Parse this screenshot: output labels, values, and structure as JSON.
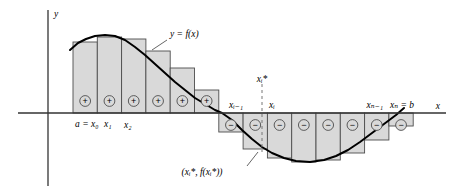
{
  "figure": {
    "axes": {
      "x_label": "x",
      "y_label": "y",
      "x_axis_y_px": 113,
      "y_axis_x_px": 48,
      "x_axis_from_px": 18,
      "x_axis_to_px": 446,
      "y_axis_from_px": 10,
      "y_axis_to_px": 186
    },
    "colors": {
      "rect_fill": "#d9d9d9",
      "rect_stroke": "#4d4d4d",
      "curve_stroke": "#000000",
      "axis_stroke": "#333333",
      "leader_stroke": "#555555",
      "dashed_stroke": "#777777",
      "text": "#000000"
    },
    "curve_label": "y = f(x)",
    "point_label": "(xᵢ*, f(xᵢ*))",
    "labels": {
      "a_x0": "a = x₀",
      "x1": "x₁",
      "x2": "x₂",
      "xi_minus_1": "xᵢ₋₁",
      "xi": "xᵢ",
      "xi_star": "xᵢ*",
      "xn_minus_1": "xₙ₋₁",
      "xn_b": "xₙ = b"
    },
    "sign_plus": "+",
    "sign_minus": "−"
  },
  "chart_data": {
    "type": "area",
    "xlabel": "x",
    "ylabel": "y",
    "grid": false,
    "legend": null,
    "curve_label": "y = f(x)",
    "partition_start_px": 73,
    "rect_width_px": 24.3,
    "zero_crossing_px": 222,
    "rectangles": [
      {
        "index": 1,
        "x_left_px": 73.0,
        "top_px": 42,
        "bottom_px": 113,
        "sign": "+"
      },
      {
        "index": 2,
        "x_left_px": 97.3,
        "top_px": 37,
        "bottom_px": 113,
        "sign": "+"
      },
      {
        "index": 3,
        "x_left_px": 121.6,
        "top_px": 39,
        "bottom_px": 113,
        "sign": "+"
      },
      {
        "index": 4,
        "x_left_px": 145.9,
        "top_px": 51,
        "bottom_px": 113,
        "sign": "+"
      },
      {
        "index": 5,
        "x_left_px": 170.2,
        "top_px": 68,
        "bottom_px": 113,
        "sign": "+"
      },
      {
        "index": 6,
        "x_left_px": 194.5,
        "top_px": 90,
        "bottom_px": 113,
        "sign": "+"
      },
      {
        "index": 7,
        "x_left_px": 218.8,
        "top_px": 113,
        "bottom_px": 132,
        "sign": "−"
      },
      {
        "index": 8,
        "x_left_px": 243.1,
        "top_px": 113,
        "bottom_px": 149,
        "sign": "−"
      },
      {
        "index": 9,
        "x_left_px": 267.4,
        "top_px": 113,
        "bottom_px": 158,
        "sign": "−"
      },
      {
        "index": 10,
        "x_left_px": 291.7,
        "top_px": 113,
        "bottom_px": 162,
        "sign": "−"
      },
      {
        "index": 11,
        "x_left_px": 316.0,
        "top_px": 113,
        "bottom_px": 160,
        "sign": "−"
      },
      {
        "index": 12,
        "x_left_px": 340.3,
        "top_px": 113,
        "bottom_px": 153,
        "sign": "−"
      },
      {
        "index": 13,
        "x_left_px": 364.6,
        "top_px": 113,
        "bottom_px": 140,
        "sign": "−"
      },
      {
        "index": 14,
        "x_left_px": 388.9,
        "top_px": 113,
        "bottom_px": 126,
        "sign": "−"
      }
    ],
    "curve_points_px": [
      [
        70,
        50
      ],
      [
        78,
        43
      ],
      [
        86,
        39
      ],
      [
        95,
        36
      ],
      [
        105,
        35
      ],
      [
        115,
        36
      ],
      [
        125,
        40
      ],
      [
        135,
        47
      ],
      [
        145,
        55
      ],
      [
        155,
        64
      ],
      [
        165,
        73
      ],
      [
        175,
        82
      ],
      [
        185,
        90
      ],
      [
        195,
        98
      ],
      [
        205,
        104
      ],
      [
        215,
        110
      ],
      [
        222,
        113
      ],
      [
        232,
        120
      ],
      [
        242,
        130
      ],
      [
        252,
        139
      ],
      [
        262,
        147
      ],
      [
        272,
        153
      ],
      [
        284,
        158
      ],
      [
        296,
        161
      ],
      [
        310,
        162
      ],
      [
        324,
        160
      ],
      [
        336,
        156
      ],
      [
        348,
        150
      ],
      [
        360,
        142
      ],
      [
        372,
        133
      ],
      [
        384,
        124
      ],
      [
        396,
        115
      ],
      [
        404,
        108
      ]
    ]
  }
}
